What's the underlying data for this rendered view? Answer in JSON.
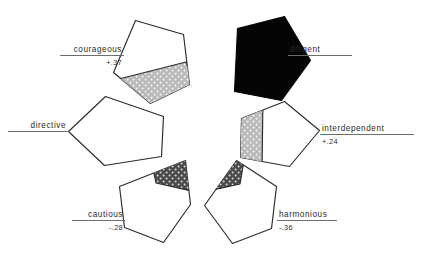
{
  "figure": {
    "type": "radial-pentagon-diagram",
    "background": "#ffffff",
    "outline_color": "#2b2b2b",
    "solid_fill_color": "#050505",
    "light_pattern_color": "#b9b9b9",
    "dark_pattern_color": "#4a4a4a",
    "rule_color": "#6d6d6d"
  },
  "nodes": [
    {
      "id": "courageous",
      "label": "courageous",
      "value": "+.37",
      "side": "left",
      "fill": "outline-with-light-wedge",
      "wedge_position": "lower-right"
    },
    {
      "id": "diligent",
      "label": "diligent",
      "value": "",
      "side": "right",
      "fill": "solid-black",
      "wedge_position": "none"
    },
    {
      "id": "directive",
      "label": "directive",
      "value": "",
      "side": "left",
      "fill": "outline-only",
      "wedge_position": "none"
    },
    {
      "id": "interdependent",
      "label": "interdependent",
      "value": "+.24",
      "side": "right",
      "fill": "outline-with-light-wedge",
      "wedge_position": "left"
    },
    {
      "id": "cautious",
      "label": "cautious",
      "value": "-.28",
      "side": "left",
      "fill": "outline-with-dark-wedge",
      "wedge_position": "top-right"
    },
    {
      "id": "harmonious",
      "label": "harmonious",
      "value": "-.36",
      "side": "right",
      "fill": "outline-with-dark-wedge",
      "wedge_position": "top-left"
    }
  ]
}
